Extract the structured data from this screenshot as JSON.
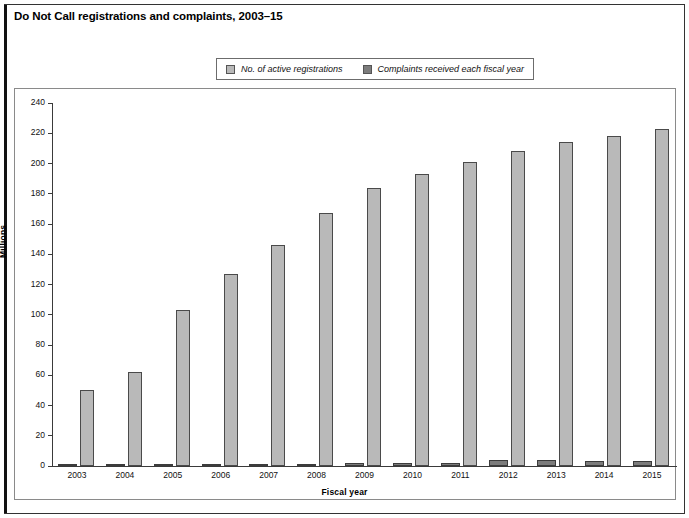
{
  "title": "Do Not Call registrations and complaints, 2003–15",
  "legend": {
    "position": "top-center",
    "items": [
      {
        "label": "No. of active registrations",
        "swatch": "legend-swatch-registrations",
        "color": "#b9b9b9"
      },
      {
        "label": "Complaints received each fiscal year",
        "swatch": "legend-swatch-complaints",
        "color": "#7c7c7c"
      }
    ]
  },
  "chart_data": {
    "type": "bar",
    "title": "Do Not Call registrations and complaints, 2003–15",
    "xlabel": "Fiscal year",
    "ylabel": "Millions",
    "ylim": [
      0,
      240
    ],
    "ytick_step": 20,
    "yticks": [
      0,
      20,
      40,
      60,
      80,
      100,
      120,
      140,
      160,
      180,
      200,
      220,
      240
    ],
    "ytick_labels": [
      "0",
      "20",
      "40",
      "60",
      "80",
      "100",
      "120",
      "140",
      "160",
      "180",
      "200",
      "220",
      "240"
    ],
    "grid": false,
    "legend_position": "top-center",
    "categories": [
      "2003",
      "2004",
      "2005",
      "2006",
      "2007",
      "2008",
      "2009",
      "2010",
      "2011",
      "2012",
      "2013",
      "2014",
      "2015"
    ],
    "series": [
      {
        "name": "Complaints received each fiscal year",
        "color": "#7c7c7c",
        "values": [
          0.2,
          0.6,
          0.8,
          1.0,
          1.2,
          1.5,
          1.7,
          1.8,
          2.2,
          3.8,
          3.7,
          3.2,
          3.6
        ]
      },
      {
        "name": "No. of active registrations",
        "color": "#b9b9b9",
        "values": [
          50,
          62,
          103,
          127,
          146,
          167,
          184,
          193,
          201,
          208,
          214,
          218,
          223
        ]
      }
    ]
  }
}
